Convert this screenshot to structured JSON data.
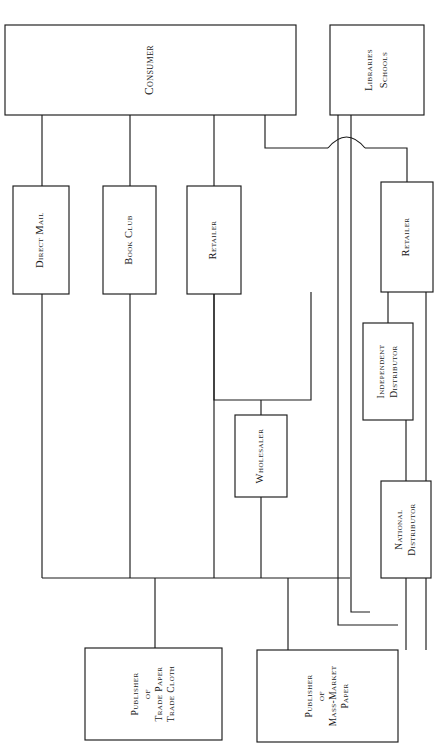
{
  "diagram": {
    "orientation": "rotated-90",
    "stroke_color": "#1a1a1a",
    "background_color": "#ffffff",
    "nodes": [
      {
        "id": "consumer",
        "label": "Consumer",
        "lines": [
          "Consumer"
        ],
        "x": 5,
        "y": 25,
        "w": 291,
        "h": 90,
        "font_size": 11.5,
        "line_gap": 13
      },
      {
        "id": "libraries-schools",
        "label": "Libraries Schools",
        "lines": [
          "Libraries",
          "Schools"
        ],
        "x": 330,
        "y": 25,
        "w": 94,
        "h": 90,
        "font_size": 10.5,
        "line_gap": 15
      },
      {
        "id": "direct-mail",
        "label": "Direct Mail",
        "lines": [
          "Direct Mail"
        ],
        "x": 13,
        "y": 186,
        "w": 56,
        "h": 108,
        "font_size": 10.5,
        "line_gap": 13
      },
      {
        "id": "book-club",
        "label": "Book Club",
        "lines": [
          "Book Club"
        ],
        "x": 103,
        "y": 186,
        "w": 53,
        "h": 108,
        "font_size": 10.5,
        "line_gap": 13
      },
      {
        "id": "retailer-left",
        "label": "Retailer",
        "lines": [
          "Retailer"
        ],
        "x": 187,
        "y": 186,
        "w": 54,
        "h": 108,
        "font_size": 10.5,
        "line_gap": 13
      },
      {
        "id": "retailer-right",
        "label": "Retailer",
        "lines": [
          "Retailer"
        ],
        "x": 381,
        "y": 182,
        "w": 52,
        "h": 110,
        "font_size": 10.5,
        "line_gap": 13
      },
      {
        "id": "independent-distributor",
        "label": "Independent Distributor",
        "lines": [
          "Independent",
          "Distributor"
        ],
        "x": 363,
        "y": 323,
        "w": 50,
        "h": 97,
        "font_size": 9.5,
        "line_gap": 13
      },
      {
        "id": "wholesaler",
        "label": "Wholesaler",
        "lines": [
          "Wholesaler"
        ],
        "x": 235,
        "y": 415,
        "w": 52,
        "h": 82,
        "font_size": 10.5,
        "line_gap": 13
      },
      {
        "id": "national-distributor",
        "label": "National Distributor",
        "lines": [
          "National",
          "Distributor"
        ],
        "x": 381,
        "y": 481,
        "w": 50,
        "h": 97,
        "font_size": 9.5,
        "line_gap": 13
      },
      {
        "id": "publisher-trade",
        "label": "Publisher of Trade Paper Trade Cloth",
        "lines": [
          "Publisher",
          "of",
          "Trade Paper",
          "Trade Cloth"
        ],
        "x": 85,
        "y": 648,
        "w": 137,
        "h": 92,
        "font_size": 9.5,
        "line_gap": 12
      },
      {
        "id": "publisher-mass-market",
        "label": "Publisher of Mass-Market Paper",
        "lines": [
          "Publisher",
          "of",
          "Mass-Market",
          "Paper"
        ],
        "x": 257,
        "y": 650,
        "w": 141,
        "h": 92,
        "font_size": 9.5,
        "line_gap": 12
      }
    ],
    "edges": [
      {
        "id": "consumer-to-direct-mail",
        "from": "consumer",
        "to": "direct-mail",
        "path": "M 42 115 L 42 186"
      },
      {
        "id": "consumer-to-book-club",
        "from": "consumer",
        "to": "book-club",
        "path": "M 130 115 L 130 186"
      },
      {
        "id": "consumer-to-retailer-left",
        "from": "consumer",
        "to": "retailer-left",
        "path": "M 214 115 L 214 186"
      },
      {
        "id": "consumer-to-retailer-right",
        "from": "consumer",
        "to": "retailer-right",
        "path": "M 265 115 L 265 148 L 328 148 M 365 148 L 407 148 L 407 182"
      },
      {
        "id": "consumer-hop-over-library-lines",
        "from": "consumer",
        "to": "retailer-right",
        "path": "M 328 148 Q 346.5 126 365 148"
      },
      {
        "id": "libraries-to-independent",
        "from": "libraries-schools",
        "to": "independent-distributor",
        "path": "M 338 115 L 338 625 L 398 625"
      },
      {
        "id": "libraries-to-national",
        "from": "libraries-schools",
        "to": "national-distributor",
        "path": "M 351 115 L 351 612 L 370 612"
      },
      {
        "id": "direct-mail-to-bus",
        "from": "direct-mail",
        "to": "publisher-trade",
        "path": "M 42 294 L 42 578"
      },
      {
        "id": "book-club-to-bus",
        "from": "book-club",
        "to": "publisher-trade",
        "path": "M 130 294 L 130 578"
      },
      {
        "id": "retailer-left-to-bus",
        "from": "retailer-left",
        "to": "publisher-trade",
        "path": "M 214 294 L 214 578"
      },
      {
        "id": "retailer-left-to-wholesaler",
        "from": "retailer-left",
        "to": "wholesaler",
        "path": "M 214 294 L 214 400 L 311 400 L 311 292 M 261 400 L 261 415"
      },
      {
        "id": "wholesaler-to-bus",
        "from": "wholesaler",
        "to": "publisher-trade",
        "path": "M 261 497 L 261 578"
      },
      {
        "id": "retailer-right-to-independent",
        "from": "retailer-right",
        "to": "independent-distributor",
        "path": "M 388 292 L 388 323"
      },
      {
        "id": "retailer-right-to-bus",
        "from": "retailer-right",
        "to": "publisher-mass-market",
        "path": "M 426 292 L 426 650"
      },
      {
        "id": "independent-to-national",
        "from": "independent-distributor",
        "to": "national-distributor",
        "path": "M 406 420 L 406 481"
      },
      {
        "id": "national-to-bus",
        "from": "national-distributor",
        "to": "publisher-mass-market",
        "path": "M 406 578 L 406 650"
      },
      {
        "id": "bottom-bus",
        "from": "channels",
        "to": "publishers",
        "path": "M 42 578 L 350 578"
      },
      {
        "id": "bus-to-publisher-trade",
        "from": "channels",
        "to": "publisher-trade",
        "path": "M 155 578 L 155 648"
      },
      {
        "id": "bus-to-publisher-mass-market",
        "from": "channels",
        "to": "publisher-mass-market",
        "path": "M 288 578 L 288 650"
      }
    ]
  }
}
